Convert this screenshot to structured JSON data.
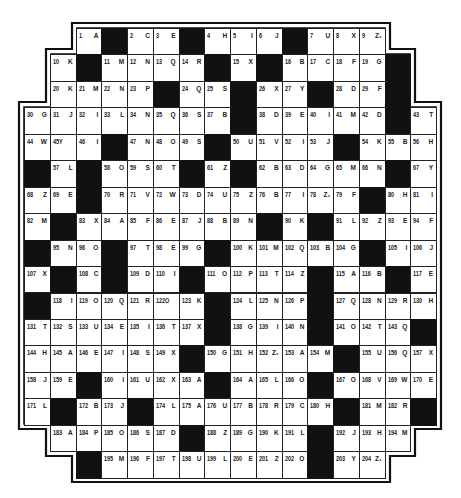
{
  "puzzle": {
    "type": "acrostic-grid",
    "geometry": {
      "x0": 24,
      "y0": 28,
      "cell_w": 25.75,
      "cell_h": 26.45
    },
    "row_start_cols": [
      2,
      1,
      1,
      0,
      0,
      0,
      0,
      0,
      0,
      0,
      0,
      0,
      0,
      0,
      0,
      1,
      2
    ],
    "rows": [
      [
        "1|A",
        "#",
        "2|C",
        "3|E",
        "#",
        "4|H",
        "5|I",
        "6|J",
        "#",
        "7|U",
        "8|X",
        "9|Z₁"
      ],
      [
        "10|K",
        "#",
        "11|M",
        "12|N",
        "13|Q",
        "14|R",
        "#",
        "15|X",
        "#",
        "16|B",
        "17|C",
        "18|F",
        "19|G",
        "#"
      ],
      [
        "20|K",
        "21|M",
        "22|N",
        "23|P",
        "#",
        "24|Q",
        "25|S",
        "#",
        "26|X",
        "27|Y",
        "#",
        "28|D",
        "29|F",
        "#"
      ],
      [
        "30|G",
        "31|J",
        "32|I",
        "33|L",
        "34|N",
        "35|Q",
        "36|S",
        "37|B",
        "#",
        "38|D",
        "39|E",
        "40|I",
        "41|M",
        "42|D",
        "#",
        "43|T"
      ],
      [
        "44|W",
        "45Y|",
        "46|I",
        "#",
        "47|N",
        "48|O",
        "49|S",
        "#",
        "50|U",
        "51|V",
        "52|I",
        "53|J",
        "#",
        "54|K",
        "55|B",
        "56|H"
      ],
      [
        "#",
        "57|L",
        "#",
        "58|O",
        "59|S",
        "60|T",
        "#",
        "61|Z",
        "#",
        "62|B",
        "63|D",
        "64|G",
        "65|M",
        "66|N",
        "#",
        "67|Y"
      ],
      [
        "68|Z",
        "69|E",
        "#",
        "70|R",
        "71|V",
        "72|W",
        "73|D",
        "74|U",
        "75|Z",
        "76|B",
        "77|I",
        "78|Z₁",
        "79|F",
        "#",
        "80|H",
        "81|I"
      ],
      [
        "82|M",
        "#",
        "83|X",
        "84|A",
        "85|F",
        "86|E",
        "87|J",
        "88|B",
        "89|N",
        "#",
        "90|K",
        "#",
        "91|L",
        "92|Z",
        "93|E",
        "94|F"
      ],
      [
        "#",
        "95|N",
        "96|O",
        "#",
        "97|T",
        "98|E",
        "99|G",
        "#",
        "100|K",
        "101|M",
        "102|Q",
        "103|B",
        "104|G",
        "#",
        "105|I",
        "106|J"
      ],
      [
        "107|X",
        "#",
        "108|C",
        "#",
        "109|D",
        "110|I",
        "#",
        "111|O",
        "112|P",
        "113|T",
        "114|Z",
        "#",
        "115|A",
        "116|B",
        "#",
        "117|E"
      ],
      [
        "#",
        "118|I",
        "119|O",
        "120|Q",
        "121|R",
        "122O|",
        "123|K",
        "#",
        "124|L",
        "125|N",
        "126|P",
        "#",
        "127|Q",
        "128|N",
        "129|R",
        "130|H"
      ],
      [
        "131|T",
        "132|S",
        "133|U",
        "134|E",
        "135|I",
        "136|T",
        "137|X",
        "#",
        "138|G",
        "139|I",
        "140|N",
        "#",
        "141|O",
        "142|T",
        "143|Q",
        "#"
      ],
      [
        "144|H",
        "145|A",
        "146|E",
        "147|I",
        "148|S",
        "149|X",
        "#",
        "150|G",
        "151|H",
        "152|Z₁",
        "153|A",
        "154|M",
        "#",
        "155|U",
        "156|Q",
        "157|X"
      ],
      [
        "158|J",
        "159|E",
        "#",
        "160|I",
        "161|U",
        "162|X",
        "163|A",
        "#",
        "164|A",
        "165|L",
        "166|O",
        "#",
        "167|O",
        "168|V",
        "169|W",
        "170|E"
      ],
      [
        "171|L",
        "#",
        "172|B",
        "173|J",
        "#",
        "174|L",
        "175|A",
        "176|U",
        "177|B",
        "178|R",
        "179|C",
        "180|H",
        "#",
        "181|M",
        "182|R",
        "#"
      ],
      [
        "183|A",
        "184|P",
        "185|O",
        "186|S",
        "187|D",
        "#",
        "188|Z",
        "189|G",
        "190|K",
        "191|L",
        "#",
        "192|J",
        "193|H",
        "194|M"
      ],
      [
        "#",
        "195|M",
        "196|F",
        "197|T",
        "198|U",
        "199|L",
        "200|E",
        "201|Z",
        "202|O",
        "#",
        "203|Y",
        "204|Z₁"
      ]
    ],
    "colors": {
      "line": "#222222",
      "black_square": "#111111",
      "background": "#ffffff"
    }
  }
}
